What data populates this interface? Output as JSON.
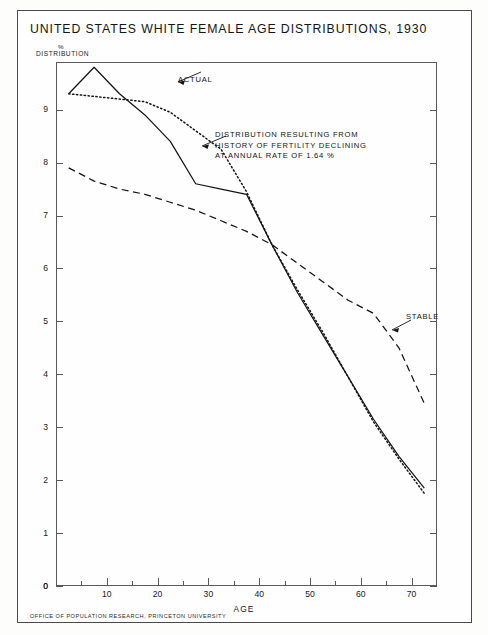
{
  "title": "UNITED STATES WHITE FEMALE AGE DISTRIBUTIONS, 1930",
  "y_axis_label_line1": "%",
  "y_axis_label_line2": "DISTRIBUTION",
  "x_axis_title": "AGE",
  "footer": "OFFICE OF POPULATION RESEARCH, PRINCETON UNIVERSITY",
  "annotations": {
    "actual": "ACTUAL",
    "stable": "STABLE",
    "declining_line1": "DISTRIBUTION RESULTING FROM",
    "declining_line2": "HISTORY OF FERTILITY DECLINING",
    "declining_line3": "AT ANNUAL RATE OF  1.64 %"
  },
  "colors": {
    "ink": "#141414",
    "frame": "#5a5a5a",
    "paper": "#fefefe"
  },
  "chart_data": {
    "type": "line",
    "title": "UNITED STATES WHITE FEMALE AGE DISTRIBUTIONS, 1930",
    "xlabel": "AGE",
    "ylabel": "% DISTRIBUTION",
    "xlim": [
      0,
      75
    ],
    "ylim": [
      0,
      9.9
    ],
    "grid": false,
    "legend": "inline-annotations",
    "x_ticks_major": [
      0,
      10,
      20,
      30,
      40,
      50,
      60,
      70
    ],
    "x_ticks_minor": [
      5,
      15,
      25,
      35,
      45,
      55,
      65
    ],
    "y_ticks_major": [
      0,
      1,
      2,
      3,
      4,
      5,
      6,
      7,
      8,
      9
    ],
    "series": [
      {
        "name": "ACTUAL",
        "style": "solid",
        "x": [
          2.5,
          7.5,
          12.5,
          17.5,
          22.5,
          27.5,
          32.5,
          37.5,
          42.5,
          47.5,
          52.5,
          57.5,
          62.5,
          67.5,
          72.5
        ],
        "values": [
          9.3,
          9.8,
          9.3,
          8.9,
          8.4,
          7.6,
          7.5,
          7.4,
          6.45,
          5.55,
          4.75,
          3.95,
          3.15,
          2.45,
          1.85
        ]
      },
      {
        "name": "DISTRIBUTION RESULTING FROM HISTORY OF FERTILITY DECLINING AT ANNUAL RATE OF 1.64 %",
        "style": "dotted",
        "x": [
          2.5,
          7.5,
          12.5,
          17.5,
          22.5,
          27.5,
          32.5,
          37.5,
          42.5,
          47.5,
          52.5,
          57.5,
          62.5,
          67.5,
          72.5
        ],
        "values": [
          9.3,
          9.25,
          9.2,
          9.15,
          8.95,
          8.6,
          8.25,
          7.45,
          6.45,
          5.6,
          4.8,
          3.95,
          3.1,
          2.4,
          1.75
        ]
      },
      {
        "name": "STABLE",
        "style": "dashed",
        "x": [
          2.5,
          7.5,
          12.5,
          17.5,
          22.5,
          27.5,
          32.5,
          37.5,
          42.5,
          47.5,
          52.5,
          57.5,
          62.5,
          67.5,
          72.5
        ],
        "values": [
          7.9,
          7.65,
          7.5,
          7.4,
          7.25,
          7.1,
          6.9,
          6.7,
          6.45,
          6.1,
          5.75,
          5.4,
          5.15,
          4.5,
          3.45
        ]
      }
    ]
  }
}
